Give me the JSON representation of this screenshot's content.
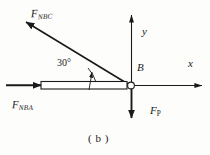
{
  "figure": {
    "caption": "( b )",
    "point_label": "B",
    "axis_x_label": "x",
    "axis_y_label": "y",
    "angle_label": "30°",
    "forces": [
      {
        "name": "F_NBC",
        "symbol": "F",
        "subscript": "NBC",
        "subscript_style": "italic",
        "direction": "up-left",
        "angle_deg": 30,
        "description": "force along member BC directed up and to the left"
      },
      {
        "name": "F_NBA",
        "symbol": "F",
        "subscript": "NBA",
        "subscript_style": "italic",
        "direction": "right",
        "angle_deg": 0,
        "description": "force along member BA directed to the right"
      },
      {
        "name": "F_P",
        "symbol": "F",
        "subscript": "P",
        "subscript_style": "upright",
        "direction": "down",
        "angle_deg": 270,
        "description": "applied load directed vertically downward at B"
      }
    ],
    "colors": {
      "stroke": "#1a1a1a",
      "background": "#fdfdfc",
      "member_fill": "#ffffff"
    }
  }
}
